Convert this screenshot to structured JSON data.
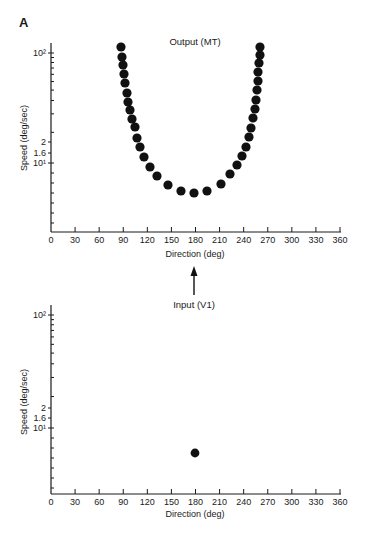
{
  "panel_label": "A",
  "arrow": "up-arrow",
  "colors": {
    "dots": "#111111",
    "axes": "#1a1a1a",
    "background": "#ffffff"
  },
  "chart_data": [
    {
      "type": "scatter",
      "title": "Output (MT)",
      "xlabel": "Direction (deg)",
      "ylabel": "Speed (deg/sec)",
      "xlim": [
        0,
        360
      ],
      "x_ticks": [
        "0",
        "30",
        "60",
        "90",
        "120",
        "150",
        "180",
        "210",
        "240",
        "270",
        "300",
        "330",
        "360"
      ],
      "y_scale": "log",
      "y_tick_labels": [
        "10²",
        "2",
        "1.6",
        "10¹"
      ],
      "grid": false,
      "points": [
        {
          "x": 87,
          "y": 113
        },
        {
          "x": 88,
          "y": 92
        },
        {
          "x": 90,
          "y": 78
        },
        {
          "x": 91,
          "y": 64
        },
        {
          "x": 92,
          "y": 53
        },
        {
          "x": 95,
          "y": 43
        },
        {
          "x": 96,
          "y": 36
        },
        {
          "x": 98,
          "y": 30
        },
        {
          "x": 101,
          "y": 25
        },
        {
          "x": 105,
          "y": 21
        },
        {
          "x": 107,
          "y": 17
        },
        {
          "x": 111,
          "y": 14
        },
        {
          "x": 116,
          "y": 11
        },
        {
          "x": 123,
          "y": 9.2
        },
        {
          "x": 132,
          "y": 7.6
        },
        {
          "x": 146,
          "y": 6.3
        },
        {
          "x": 162,
          "y": 5.6
        },
        {
          "x": 178,
          "y": 5.3
        },
        {
          "x": 194,
          "y": 5.6
        },
        {
          "x": 212,
          "y": 6.4
        },
        {
          "x": 223,
          "y": 7.9
        },
        {
          "x": 232,
          "y": 9.6
        },
        {
          "x": 238,
          "y": 11.6
        },
        {
          "x": 243,
          "y": 14
        },
        {
          "x": 247,
          "y": 17
        },
        {
          "x": 249,
          "y": 21
        },
        {
          "x": 252,
          "y": 26
        },
        {
          "x": 254,
          "y": 31
        },
        {
          "x": 255,
          "y": 37
        },
        {
          "x": 257,
          "y": 46
        },
        {
          "x": 258,
          "y": 56
        },
        {
          "x": 258,
          "y": 67
        },
        {
          "x": 259,
          "y": 81
        },
        {
          "x": 260,
          "y": 95
        },
        {
          "x": 260,
          "y": 113
        }
      ],
      "pixel_points": [
        [
          121,
          47
        ],
        [
          122,
          57
        ],
        [
          123,
          65
        ],
        [
          124,
          74
        ],
        [
          125,
          83
        ],
        [
          127,
          93
        ],
        [
          128,
          102
        ],
        [
          130,
          110
        ],
        [
          132,
          119
        ],
        [
          135,
          127
        ],
        [
          137,
          138
        ],
        [
          140,
          147
        ],
        [
          144,
          157
        ],
        [
          150,
          167
        ],
        [
          157,
          176
        ],
        [
          168,
          185
        ],
        [
          181,
          191
        ],
        [
          194,
          193
        ],
        [
          207,
          191
        ],
        [
          221,
          184
        ],
        [
          230,
          174
        ],
        [
          237,
          165
        ],
        [
          242,
          156
        ],
        [
          246,
          147
        ],
        [
          249,
          137
        ],
        [
          251,
          128
        ],
        [
          253,
          118
        ],
        [
          255,
          109
        ],
        [
          256,
          100
        ],
        [
          257,
          90
        ],
        [
          258,
          81
        ],
        [
          258,
          72
        ],
        [
          259,
          63
        ],
        [
          260,
          55
        ],
        [
          260,
          47
        ]
      ]
    },
    {
      "type": "scatter",
      "title": "Input (V1)",
      "xlabel": "Direction (deg)",
      "ylabel": "Speed (deg/sec)",
      "xlim": [
        0,
        360
      ],
      "x_ticks": [
        "0",
        "30",
        "60",
        "90",
        "120",
        "150",
        "180",
        "210",
        "240",
        "270",
        "300",
        "330",
        "360"
      ],
      "y_scale": "log",
      "y_tick_labels": [
        "10²",
        "2",
        "1.6",
        "10¹"
      ],
      "grid": false,
      "points": [
        {
          "x": 179,
          "y": 6
        }
      ],
      "pixel_points": [
        [
          195,
          453
        ]
      ]
    }
  ]
}
